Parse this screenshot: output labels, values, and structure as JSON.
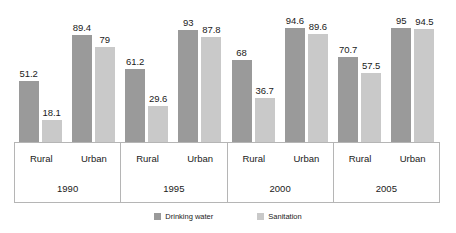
{
  "chart_data": {
    "type": "bar",
    "title": "",
    "subtitle": "",
    "xlabel": "",
    "ylabel": "",
    "ylim": [
      0,
      100
    ],
    "grid": false,
    "legend_position": "bottom-center",
    "orientation": "vertical",
    "grouping": "grouped",
    "categories": [
      "1990 Rural",
      "1990 Urban",
      "1995 Rural",
      "1995 Urban",
      "2000 Rural",
      "2000 Urban",
      "2005 Rural",
      "2005 Urban"
    ],
    "years": [
      "1990",
      "1995",
      "2000",
      "2005"
    ],
    "areas": [
      "Rural",
      "Urban"
    ],
    "series": [
      {
        "name": "Drinking water",
        "color": "#9a9a9a",
        "values": [
          51.2,
          89.4,
          61.2,
          93,
          68,
          94.6,
          70.7,
          95
        ]
      },
      {
        "name": "Sanitation",
        "color": "#c9c9c9",
        "values": [
          18.1,
          79,
          29.6,
          87.8,
          36.7,
          89.6,
          57.5,
          94.5
        ]
      }
    ],
    "groups": [
      {
        "year": "1990",
        "subgroups": [
          {
            "area": "Rural",
            "bars": [
              {
                "series": "Drinking water",
                "value": "51.2"
              },
              {
                "series": "Sanitation",
                "value": "18.1"
              }
            ]
          },
          {
            "area": "Urban",
            "bars": [
              {
                "series": "Drinking water",
                "value": "89.4"
              },
              {
                "series": "Sanitation",
                "value": "79"
              }
            ]
          }
        ]
      },
      {
        "year": "1995",
        "subgroups": [
          {
            "area": "Rural",
            "bars": [
              {
                "series": "Drinking water",
                "value": "61.2"
              },
              {
                "series": "Sanitation",
                "value": "29.6"
              }
            ]
          },
          {
            "area": "Urban",
            "bars": [
              {
                "series": "Drinking water",
                "value": "93"
              },
              {
                "series": "Sanitation",
                "value": "87.8"
              }
            ]
          }
        ]
      },
      {
        "year": "2000",
        "subgroups": [
          {
            "area": "Rural",
            "bars": [
              {
                "series": "Drinking water",
                "value": "68"
              },
              {
                "series": "Sanitation",
                "value": "36.7"
              }
            ]
          },
          {
            "area": "Urban",
            "bars": [
              {
                "series": "Drinking water",
                "value": "94.6"
              },
              {
                "series": "Sanitation",
                "value": "89.6"
              }
            ]
          }
        ]
      },
      {
        "year": "2005",
        "subgroups": [
          {
            "area": "Rural",
            "bars": [
              {
                "series": "Drinking water",
                "value": "70.7"
              },
              {
                "series": "Sanitation",
                "value": "57.5"
              }
            ]
          },
          {
            "area": "Urban",
            "bars": [
              {
                "series": "Drinking water",
                "value": "95"
              },
              {
                "series": "Sanitation",
                "value": "94.5"
              }
            ]
          }
        ]
      }
    ]
  },
  "legend": {
    "items": [
      {
        "label": "Drinking water",
        "color": "#9a9a9a"
      },
      {
        "label": "Sanitation",
        "color": "#c9c9c9"
      }
    ]
  }
}
